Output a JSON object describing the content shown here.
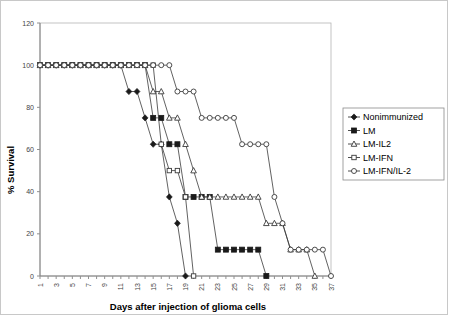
{
  "chart_data": {
    "type": "line",
    "title": "",
    "xlabel": "Days after injection of glioma cells",
    "ylabel": "% Survival",
    "xlim": [
      1,
      37
    ],
    "ylim": [
      0,
      120
    ],
    "ytick_step": 20,
    "yticks": [
      0,
      20,
      40,
      60,
      80,
      100,
      120
    ],
    "xticks": [
      1,
      2,
      3,
      4,
      5,
      6,
      7,
      8,
      9,
      10,
      11,
      12,
      13,
      14,
      15,
      16,
      17,
      18,
      19,
      20,
      21,
      22,
      23,
      24,
      25,
      26,
      27,
      28,
      29,
      30,
      31,
      32,
      33,
      34,
      35,
      36,
      37
    ],
    "xtick_labels": [
      "1",
      "",
      "3",
      "",
      "5",
      "",
      "7",
      "",
      "9",
      "",
      "11",
      "",
      "13",
      "",
      "15",
      "",
      "17",
      "",
      "19",
      "",
      "21",
      "",
      "23",
      "",
      "25",
      "",
      "27",
      "",
      "29",
      "",
      "31",
      "",
      "33",
      "",
      "35",
      "",
      "37"
    ],
    "grid": false,
    "legend_position": "right",
    "series": [
      {
        "name": "Nonimmunized",
        "marker": "filled-diamond",
        "color": "#1a1a1a",
        "x": [
          1,
          2,
          3,
          4,
          5,
          6,
          7,
          8,
          9,
          10,
          11,
          12,
          13,
          14,
          15,
          16,
          17,
          18,
          19
        ],
        "values": [
          100,
          100,
          100,
          100,
          100,
          100,
          100,
          100,
          100,
          100,
          100,
          87.5,
          87.5,
          75,
          62.5,
          62.5,
          37.5,
          25,
          0
        ]
      },
      {
        "name": "LM",
        "marker": "filled-square",
        "color": "#1a1a1a",
        "x": [
          1,
          2,
          3,
          4,
          5,
          6,
          7,
          8,
          9,
          10,
          11,
          12,
          13,
          14,
          15,
          16,
          17,
          18,
          19,
          20,
          21,
          22,
          23,
          24,
          25,
          26,
          27,
          28,
          29
        ],
        "values": [
          100,
          100,
          100,
          100,
          100,
          100,
          100,
          100,
          100,
          100,
          100,
          100,
          100,
          100,
          75,
          75,
          62.5,
          62.5,
          37.5,
          37.5,
          37.5,
          37.5,
          12.5,
          12.5,
          12.5,
          12.5,
          12.5,
          12.5,
          0
        ]
      },
      {
        "name": "LM-IL2",
        "marker": "open-triangle",
        "color": "#3a3a3a",
        "x": [
          1,
          2,
          3,
          4,
          5,
          6,
          7,
          8,
          9,
          10,
          11,
          12,
          13,
          14,
          15,
          16,
          17,
          18,
          19,
          20,
          21,
          22,
          23,
          24,
          25,
          26,
          27,
          28,
          29,
          30,
          31,
          32,
          33,
          34,
          35
        ],
        "values": [
          100,
          100,
          100,
          100,
          100,
          100,
          100,
          100,
          100,
          100,
          100,
          100,
          100,
          100,
          87.5,
          87.5,
          75,
          75,
          62.5,
          50,
          37.5,
          37.5,
          37.5,
          37.5,
          37.5,
          37.5,
          37.5,
          37.5,
          25,
          25,
          25,
          12.5,
          12.5,
          12.5,
          0
        ]
      },
      {
        "name": "LM-IFN",
        "marker": "open-square",
        "color": "#3a3a3a",
        "x": [
          1,
          2,
          3,
          4,
          5,
          6,
          7,
          8,
          9,
          10,
          11,
          12,
          13,
          14,
          15,
          16,
          17,
          18,
          19,
          20
        ],
        "values": [
          100,
          100,
          100,
          100,
          100,
          100,
          100,
          100,
          100,
          100,
          100,
          100,
          100,
          100,
          100,
          62.5,
          50,
          50,
          37.5,
          0
        ]
      },
      {
        "name": "LM-IFN/IL-2",
        "marker": "open-circle",
        "color": "#3a3a3a",
        "x": [
          1,
          2,
          3,
          4,
          5,
          6,
          7,
          8,
          9,
          10,
          11,
          12,
          13,
          14,
          15,
          16,
          17,
          18,
          19,
          20,
          21,
          22,
          23,
          24,
          25,
          26,
          27,
          28,
          29,
          30,
          31,
          32,
          33,
          34,
          35,
          36,
          37
        ],
        "values": [
          100,
          100,
          100,
          100,
          100,
          100,
          100,
          100,
          100,
          100,
          100,
          100,
          100,
          100,
          100,
          100,
          100,
          87.5,
          87.5,
          87.5,
          75,
          75,
          75,
          75,
          75,
          62.5,
          62.5,
          62.5,
          62.5,
          37.5,
          25,
          12.5,
          12.5,
          12.5,
          12.5,
          12.5,
          0
        ]
      }
    ]
  },
  "legend": {
    "items": [
      {
        "label": "Nonimmunized",
        "marker": "filled-diamond"
      },
      {
        "label": "LM",
        "marker": "filled-square"
      },
      {
        "label": "LM-IL2",
        "marker": "open-triangle"
      },
      {
        "label": "LM-IFN",
        "marker": "open-square"
      },
      {
        "label": "LM-IFN/IL-2",
        "marker": "open-circle"
      }
    ]
  }
}
